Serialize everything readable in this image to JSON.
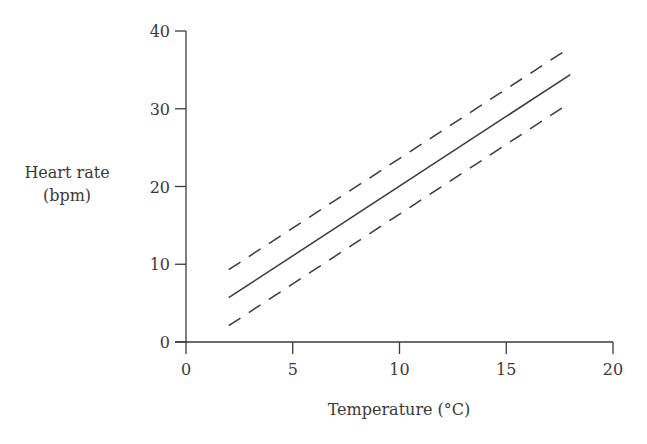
{
  "chart_data": {
    "type": "line",
    "title": "",
    "xlabel": "Temperature (°C)",
    "ylabel_lines": [
      "Heart rate",
      "(bpm)"
    ],
    "ylabel": "Heart rate (bpm)",
    "xlim": [
      0,
      20
    ],
    "ylim": [
      0,
      40
    ],
    "xticks": [
      0,
      5,
      10,
      15,
      20
    ],
    "yticks": [
      0,
      10,
      20,
      30,
      40
    ],
    "grid": false,
    "legend": null,
    "series": [
      {
        "name": "fitted line",
        "style": "solid",
        "x": [
          2,
          18
        ],
        "y": [
          5.7,
          34.4
        ]
      },
      {
        "name": "upper bound",
        "style": "dashed",
        "x": [
          2,
          18
        ],
        "y": [
          9.3,
          37.9
        ]
      },
      {
        "name": "lower bound",
        "style": "dashed",
        "x": [
          2,
          18
        ],
        "y": [
          2.1,
          30.8
        ]
      }
    ],
    "colors": {
      "line": "#3a3a3a",
      "axis": "#3a3a3a",
      "background": "#ffffff"
    }
  }
}
